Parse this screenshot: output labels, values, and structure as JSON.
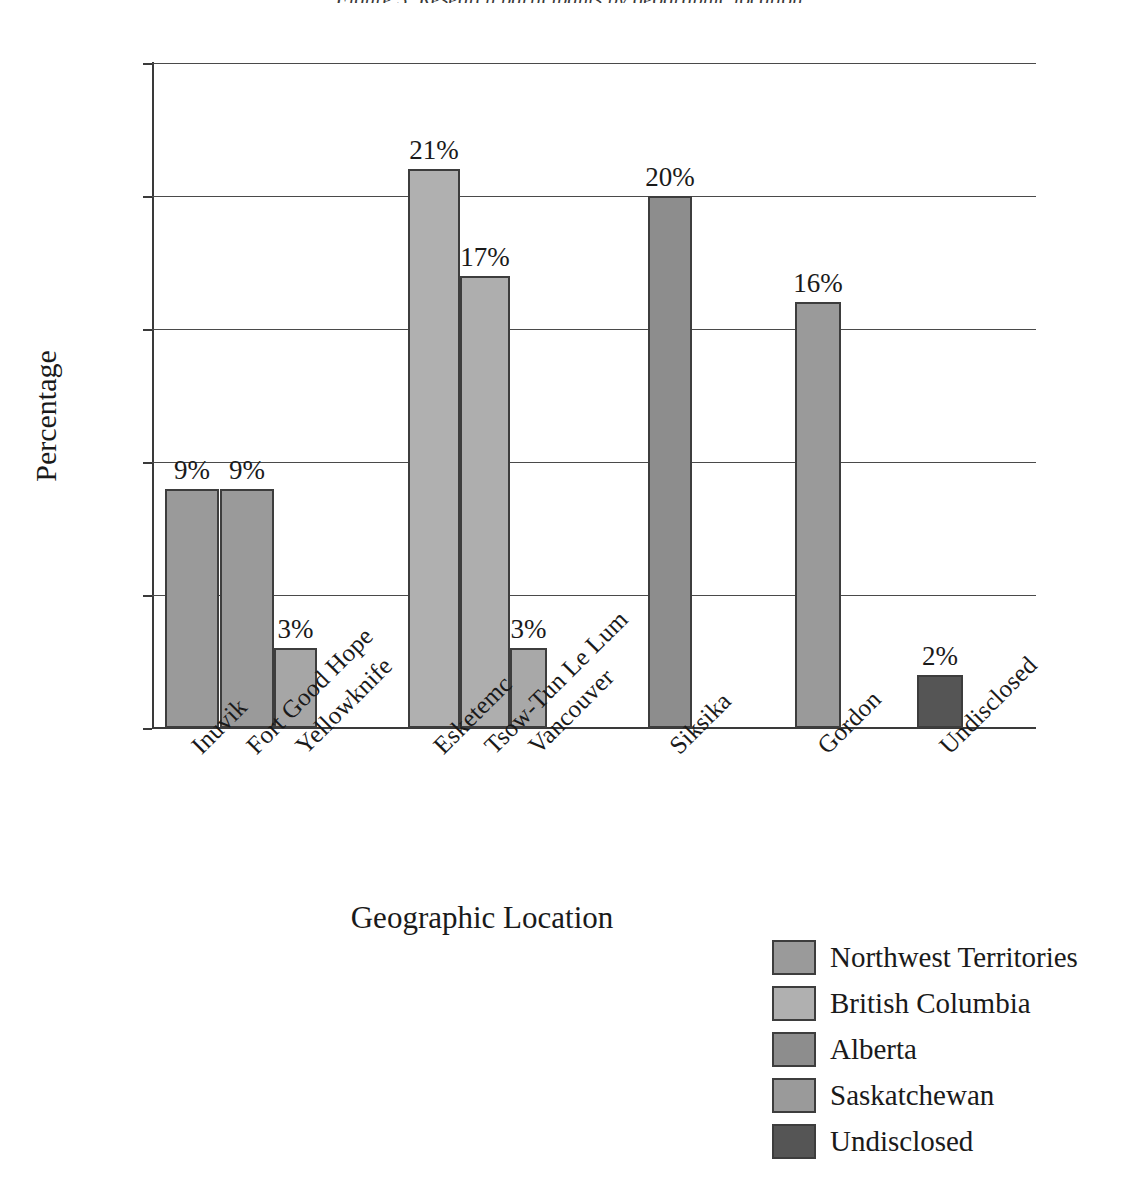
{
  "figure": {
    "top_caption_fragment": "Figure 3. Research participants by geographic location",
    "xlabel": "Geographic Location",
    "ylabel": "Percentage"
  },
  "axis": {
    "y_ticks": [
      "0",
      "5",
      "10",
      "15",
      "20",
      "25"
    ],
    "y_min": 0,
    "y_max": 25
  },
  "legend": {
    "items": [
      {
        "label": "Northwest Territories",
        "color": "#9a9a9a"
      },
      {
        "label": "British Columbia",
        "color": "#b0b0b0"
      },
      {
        "label": "Alberta",
        "color": "#8d8d8d"
      },
      {
        "label": "Saskatchewan",
        "color": "#9a9a9a"
      },
      {
        "label": "Undisclosed",
        "color": "#555555"
      }
    ]
  },
  "chart_data": {
    "type": "bar",
    "title": "Research participants by geographic location",
    "xlabel": "Geographic Location",
    "ylabel": "Percentage",
    "ylim": [
      0,
      25
    ],
    "ytick_interval": 5,
    "grid": true,
    "legend_position": "bottom-right",
    "value_format": "percent",
    "categories": [
      "Inuvik",
      "Fort Good Hope",
      "Yellowknife",
      "Esketemc",
      "Tsow-Tun Le Lum",
      "Vancouver",
      "Siksika",
      "Gordon",
      "Undisclosed"
    ],
    "values": [
      9,
      9,
      3,
      21,
      17,
      3,
      20,
      16,
      2
    ],
    "value_labels": [
      "9%",
      "9%",
      "3%",
      "21%",
      "17%",
      "3%",
      "20%",
      "16%",
      "2%"
    ],
    "groups": [
      "Northwest Territories",
      "Northwest Territories",
      "Northwest Territories",
      "British Columbia",
      "British Columbia",
      "British Columbia",
      "Alberta",
      "Saskatchewan",
      "Undisclosed"
    ],
    "colors": [
      "#9a9a9a",
      "#9a9a9a",
      "#a6a6a6",
      "#b0b0b0",
      "#aeaeae",
      "#a8a8a8",
      "#8d8d8d",
      "#9a9a9a",
      "#555555"
    ],
    "bar_geometry": [
      {
        "left": 13,
        "width": 54
      },
      {
        "left": 68,
        "width": 54
      },
      {
        "left": 122,
        "width": 43
      },
      {
        "left": 256,
        "width": 52
      },
      {
        "left": 308,
        "width": 50
      },
      {
        "left": 358,
        "width": 37
      },
      {
        "left": 496,
        "width": 44
      },
      {
        "left": 643,
        "width": 46
      },
      {
        "left": 765,
        "width": 46
      }
    ]
  }
}
